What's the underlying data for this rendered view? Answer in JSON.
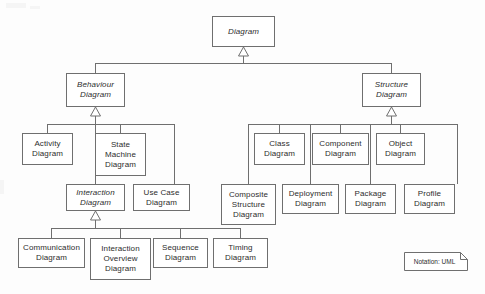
{
  "diagram": {
    "notation_note": "Notation: UML",
    "colors": {
      "stroke": "#6f6f6f",
      "text": "#2d2d2d",
      "background": "#fdfdfd",
      "node_fill": "#ffffff"
    },
    "nodes": {
      "root": "Diagram",
      "behaviour": "Behaviour\nDiagram",
      "structure": "Structure\nDiagram",
      "activity": "Activity\nDiagram",
      "state_machine": "State\nMachine\nDiagram",
      "interaction": "Interaction\nDiagram",
      "use_case": "Use Case\nDiagram",
      "communication": "Communication\nDiagram",
      "interaction_overview": "Interaction\nOverview\nDiagram",
      "sequence": "Sequence\nDiagram",
      "timing": "Timing\nDiagram",
      "class": "Class\nDiagram",
      "component": "Component\nDiagram",
      "object": "Object\nDiagram",
      "composite_structure": "Composite\nStructure\nDiagram",
      "deployment": "Deployment\nDiagram",
      "package": "Package\nDiagram",
      "profile": "Profile\nDiagram"
    },
    "abstract_nodes": [
      "root",
      "behaviour",
      "structure",
      "interaction"
    ],
    "relationships": [
      {
        "from": "behaviour",
        "to": "root",
        "type": "generalization"
      },
      {
        "from": "structure",
        "to": "root",
        "type": "generalization"
      },
      {
        "from": "activity",
        "to": "behaviour",
        "type": "generalization"
      },
      {
        "from": "state_machine",
        "to": "behaviour",
        "type": "generalization"
      },
      {
        "from": "interaction",
        "to": "behaviour",
        "type": "generalization"
      },
      {
        "from": "use_case",
        "to": "behaviour",
        "type": "generalization"
      },
      {
        "from": "communication",
        "to": "interaction",
        "type": "generalization"
      },
      {
        "from": "interaction_overview",
        "to": "interaction",
        "type": "generalization"
      },
      {
        "from": "sequence",
        "to": "interaction",
        "type": "generalization"
      },
      {
        "from": "timing",
        "to": "interaction",
        "type": "generalization"
      },
      {
        "from": "class",
        "to": "structure",
        "type": "generalization"
      },
      {
        "from": "component",
        "to": "structure",
        "type": "generalization"
      },
      {
        "from": "object",
        "to": "structure",
        "type": "generalization"
      },
      {
        "from": "composite_structure",
        "to": "structure",
        "type": "generalization"
      },
      {
        "from": "deployment",
        "to": "structure",
        "type": "generalization"
      },
      {
        "from": "package",
        "to": "structure",
        "type": "generalization"
      },
      {
        "from": "profile",
        "to": "structure",
        "type": "generalization"
      }
    ]
  }
}
